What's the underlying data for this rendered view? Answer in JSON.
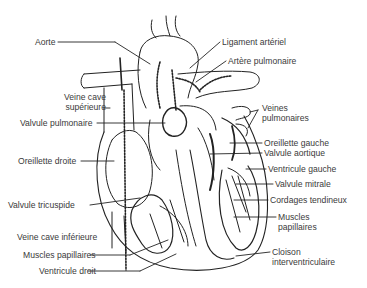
{
  "diagram": {
    "labels_left": [
      {
        "id": "aorte",
        "text": "Aorte",
        "x": 35,
        "y": 38
      },
      {
        "id": "veine-cave-superieure",
        "text": "Veine cave\nsupérieure",
        "x": 58,
        "y": 93
      },
      {
        "id": "valvule-pulmonaire",
        "text": "Valvule pulmonaire",
        "x": 20,
        "y": 119
      },
      {
        "id": "oreillette-droite",
        "text": "Oreillette droite",
        "x": 18,
        "y": 157
      },
      {
        "id": "valvule-tricuspide",
        "text": "Valvule tricuspide",
        "x": 8,
        "y": 201
      },
      {
        "id": "veine-cave-inferieure",
        "text": "Veine cave inférieure",
        "x": 17,
        "y": 233
      },
      {
        "id": "muscles-papillaires-droit",
        "text": "Muscles papillaires",
        "x": 23,
        "y": 251
      },
      {
        "id": "ventricule-droit",
        "text": "Ventricule droit",
        "x": 39,
        "y": 267
      }
    ],
    "labels_right": [
      {
        "id": "ligament-arteriel",
        "text": "Ligament artériel",
        "x": 222,
        "y": 38
      },
      {
        "id": "artere-pulmonaire",
        "text": "Artère pulmonaire",
        "x": 228,
        "y": 57
      },
      {
        "id": "veines-pulmonaires",
        "text": "Veines\npulmonaires",
        "x": 262,
        "y": 104
      },
      {
        "id": "oreillette-gauche",
        "text": "Oreillette gauche",
        "x": 264,
        "y": 139
      },
      {
        "id": "valvule-aortique",
        "text": "Valvule aortique",
        "x": 264,
        "y": 149
      },
      {
        "id": "ventricule-gauche",
        "text": "Ventricule gauche",
        "x": 268,
        "y": 165
      },
      {
        "id": "valvule-mitrale",
        "text": "Valvule mitrale",
        "x": 275,
        "y": 180
      },
      {
        "id": "cordages-tendineux",
        "text": "Cordages tendineux",
        "x": 270,
        "y": 196
      },
      {
        "id": "muscles-papillaires-gauche",
        "text": "Muscles\npapillaires",
        "x": 278,
        "y": 213
      },
      {
        "id": "cloison-interventriculaire",
        "text": "Cloison\ninterventriculaire",
        "x": 272,
        "y": 248
      }
    ]
  }
}
